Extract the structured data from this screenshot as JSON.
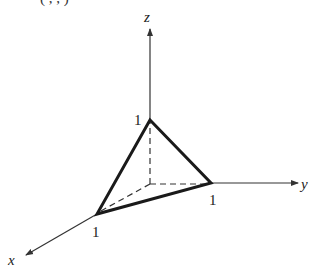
{
  "figure": {
    "type": "3d-coordinate-diagram",
    "caption_fragment": "(  ,  ,  )",
    "axes": [
      {
        "name": "x",
        "label": "x"
      },
      {
        "name": "y",
        "label": "y"
      },
      {
        "name": "z",
        "label": "z"
      }
    ],
    "intercepts": [
      {
        "axis": "x",
        "label": "1"
      },
      {
        "axis": "y",
        "label": "1"
      },
      {
        "axis": "z",
        "label": "1"
      }
    ],
    "shape": "triangle with vertices (1,0,0), (0,1,0), (0,0,1)",
    "hidden_edges": "dashed lines from origin to each intercept",
    "colors": {
      "stroke": "#1a1a1a",
      "axis": "#333333",
      "background": "#ffffff"
    }
  }
}
